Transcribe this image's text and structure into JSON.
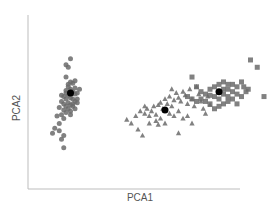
{
  "chart_data": {
    "type": "scatter",
    "title": "",
    "xlabel": "PCA1",
    "ylabel": "PCA2",
    "xlim": [
      0,
      100
    ],
    "ylim": [
      0,
      100
    ],
    "grid": false,
    "legend": null,
    "tick_labels": false,
    "series": [
      {
        "name": "group-circle",
        "marker": "circle",
        "color": "#6b6b6b",
        "centroid": [
          18,
          55
        ],
        "points": [
          [
            18,
            83
          ],
          [
            16,
            78
          ],
          [
            17,
            76
          ],
          [
            16,
            68
          ],
          [
            20,
            65
          ],
          [
            19,
            63
          ],
          [
            17,
            60
          ],
          [
            18,
            58
          ],
          [
            16,
            57
          ],
          [
            19,
            56
          ],
          [
            20,
            54
          ],
          [
            21,
            55
          ],
          [
            17,
            53
          ],
          [
            15,
            52
          ],
          [
            18,
            51
          ],
          [
            16,
            50
          ],
          [
            19,
            50
          ],
          [
            14,
            48
          ],
          [
            20,
            48
          ],
          [
            17,
            47
          ],
          [
            15,
            46
          ],
          [
            18,
            45
          ],
          [
            16,
            44
          ],
          [
            19,
            44
          ],
          [
            17,
            42
          ],
          [
            15,
            41
          ],
          [
            18,
            40
          ],
          [
            20,
            42
          ],
          [
            16,
            39
          ],
          [
            14,
            37
          ],
          [
            18,
            37
          ],
          [
            12,
            36
          ],
          [
            15,
            34
          ],
          [
            13,
            30
          ],
          [
            11,
            26
          ],
          [
            13,
            24
          ],
          [
            10,
            22
          ],
          [
            15,
            20
          ],
          [
            14,
            17
          ],
          [
            15,
            10
          ],
          [
            21,
            50
          ],
          [
            19,
            46
          ],
          [
            13,
            43
          ],
          [
            22,
            58
          ],
          [
            17,
            62
          ],
          [
            20,
            59
          ],
          [
            16,
            55
          ],
          [
            14,
            53
          ],
          [
            18,
            64
          ],
          [
            21,
            47
          ]
        ]
      },
      {
        "name": "group-triangle",
        "marker": "triangle",
        "color": "#6b6b6b",
        "centroid": [
          60,
          41
        ],
        "points": [
          [
            45,
            30
          ],
          [
            48,
            25
          ],
          [
            50,
            20
          ],
          [
            43,
            33
          ],
          [
            47,
            36
          ],
          [
            49,
            40
          ],
          [
            51,
            38
          ],
          [
            52,
            42
          ],
          [
            53,
            36
          ],
          [
            54,
            40
          ],
          [
            55,
            44
          ],
          [
            56,
            37
          ],
          [
            57,
            45
          ],
          [
            58,
            47
          ],
          [
            59,
            42
          ],
          [
            60,
            50
          ],
          [
            61,
            46
          ],
          [
            62,
            52
          ],
          [
            63,
            44
          ],
          [
            64,
            49
          ],
          [
            65,
            55
          ],
          [
            66,
            51
          ],
          [
            67,
            48
          ],
          [
            68,
            56
          ],
          [
            69,
            53
          ],
          [
            70,
            46
          ],
          [
            71,
            58
          ],
          [
            72,
            50
          ],
          [
            73,
            44
          ],
          [
            74,
            60
          ],
          [
            75,
            54
          ],
          [
            76,
            48
          ],
          [
            77,
            42
          ],
          [
            78,
            38
          ],
          [
            79,
            52
          ],
          [
            80,
            45
          ],
          [
            62,
            38
          ],
          [
            64,
            36
          ],
          [
            66,
            40
          ],
          [
            58,
            34
          ],
          [
            56,
            32
          ],
          [
            60,
            30
          ],
          [
            68,
            34
          ],
          [
            70,
            36
          ],
          [
            72,
            30
          ],
          [
            66,
            22
          ],
          [
            57,
            29
          ],
          [
            53,
            30
          ],
          [
            51,
            44
          ],
          [
            63,
            58
          ]
        ]
      },
      {
        "name": "group-square",
        "marker": "square",
        "color": "#6b6b6b",
        "centroid": [
          84,
          56
        ],
        "points": [
          [
            98,
            82
          ],
          [
            101,
            76
          ],
          [
            86,
            64
          ],
          [
            88,
            62
          ],
          [
            95,
            60
          ],
          [
            97,
            58
          ],
          [
            104,
            52
          ],
          [
            72,
            68
          ],
          [
            74,
            60
          ],
          [
            76,
            56
          ],
          [
            78,
            54
          ],
          [
            80,
            53
          ],
          [
            82,
            52
          ],
          [
            84,
            50
          ],
          [
            86,
            54
          ],
          [
            88,
            58
          ],
          [
            90,
            56
          ],
          [
            92,
            54
          ],
          [
            94,
            52
          ],
          [
            80,
            58
          ],
          [
            82,
            60
          ],
          [
            84,
            62
          ],
          [
            78,
            48
          ],
          [
            80,
            46
          ],
          [
            76,
            50
          ],
          [
            74,
            48
          ],
          [
            70,
            52
          ],
          [
            72,
            50
          ],
          [
            86,
            46
          ],
          [
            88,
            48
          ],
          [
            90,
            50
          ],
          [
            92,
            46
          ],
          [
            84,
            44
          ],
          [
            82,
            42
          ],
          [
            86,
            58
          ],
          [
            88,
            52
          ],
          [
            90,
            62
          ],
          [
            94,
            64
          ],
          [
            96,
            56
          ],
          [
            92,
            60
          ]
        ]
      }
    ]
  },
  "labels": {
    "x": "PCA1",
    "y": "PCA2"
  }
}
